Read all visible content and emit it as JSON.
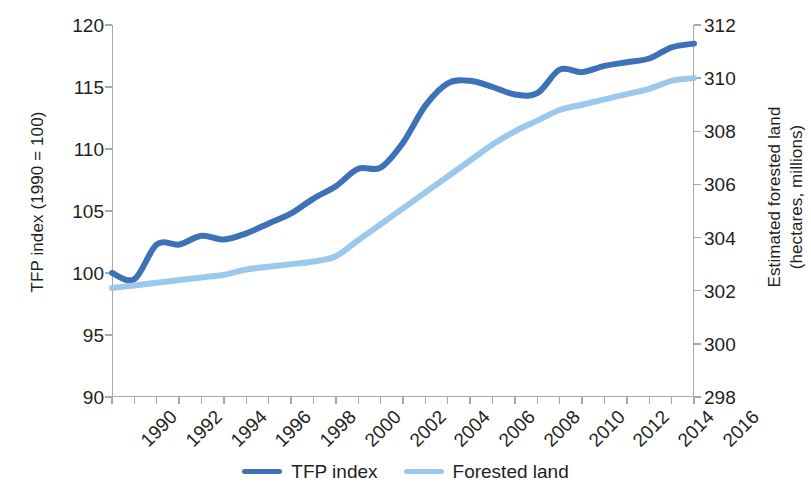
{
  "chart_data": {
    "type": "line",
    "title": "",
    "subtitle": "",
    "xlabel": "",
    "x": [
      1990,
      1991,
      1992,
      1993,
      1994,
      1995,
      1996,
      1997,
      1998,
      1999,
      2000,
      2001,
      2002,
      2003,
      2004,
      2005,
      2006,
      2007,
      2008,
      2009,
      2010,
      2011,
      2012,
      2013,
      2014,
      2015,
      2016
    ],
    "x_tick_labels": [
      "1990",
      "1992",
      "1994",
      "1996",
      "1998",
      "2000",
      "2002",
      "2004",
      "2006",
      "2008",
      "2010",
      "2012",
      "2014",
      "2016"
    ],
    "xlim": [
      1990,
      2016
    ],
    "grid": false,
    "legend_position": "bottom-center",
    "axes": [
      {
        "id": "left",
        "label": "TFP index (1990 = 100)",
        "lim": [
          90,
          120
        ],
        "ticks": [
          90,
          95,
          100,
          105,
          110,
          115,
          120
        ],
        "tick_labels": [
          "90",
          "95",
          "100",
          "105",
          "110",
          "115",
          "120"
        ]
      },
      {
        "id": "right",
        "label_line1": "Estimated forested land",
        "label_line2": "(hectares, millions)",
        "lim": [
          298,
          312
        ],
        "ticks": [
          298,
          300,
          302,
          304,
          306,
          308,
          310,
          312
        ],
        "tick_labels": [
          "298",
          "300",
          "302",
          "304",
          "306",
          "308",
          "310",
          "312"
        ]
      }
    ],
    "series": [
      {
        "name": "TFP index",
        "axis": "left",
        "color": "#3D72B8",
        "values": [
          100.0,
          99.5,
          102.3,
          102.3,
          103.0,
          102.7,
          103.2,
          104.0,
          104.8,
          106.0,
          107.0,
          108.4,
          108.5,
          110.5,
          113.5,
          115.3,
          115.5,
          115.0,
          114.4,
          114.5,
          116.4,
          116.2,
          116.7,
          117.0,
          117.3,
          118.2,
          118.5
        ]
      },
      {
        "name": "Forested land",
        "axis": "right",
        "color": "#9DC8ED",
        "values": [
          302.1,
          302.2,
          302.3,
          302.4,
          302.5,
          302.6,
          302.8,
          302.9,
          303.0,
          303.1,
          303.3,
          303.9,
          304.5,
          305.1,
          305.7,
          306.3,
          306.9,
          307.5,
          308.0,
          308.4,
          308.8,
          309.0,
          309.2,
          309.4,
          309.6,
          309.9,
          310.0
        ]
      }
    ]
  },
  "legend": {
    "items": [
      {
        "label": "TFP index",
        "color": "#3D72B8"
      },
      {
        "label": "Forested land",
        "color": "#9DC8ED"
      }
    ]
  }
}
